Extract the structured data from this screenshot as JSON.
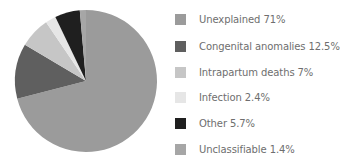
{
  "chart_data": {
    "type": "pie",
    "title": "",
    "start_angle_deg": 0,
    "direction": "clockwise",
    "legend_position": "right",
    "slices": [
      {
        "label": "Unexplained",
        "value": 71,
        "color": "#9b9b9b",
        "legend_text": "Unexplained 71%"
      },
      {
        "label": "Congenital anomalies",
        "value": 12.5,
        "color": "#5f5f5f",
        "legend_text": "Congenital anomalies 12.5%"
      },
      {
        "label": "Intrapartum deaths",
        "value": 7,
        "color": "#c6c6c6",
        "legend_text": "Intrapartum deaths 7%"
      },
      {
        "label": "Infection",
        "value": 2.4,
        "color": "#e6e6e6",
        "legend_text": "Infection 2.4%"
      },
      {
        "label": "Other",
        "value": 5.7,
        "color": "#1f1f1f",
        "legend_text": "Other 5.7%"
      },
      {
        "label": "Unclassifiable",
        "value": 1.4,
        "color": "#a6a6a6",
        "legend_text": "Unclassifiable 1.4%"
      }
    ]
  },
  "legend": {
    "items": [
      {
        "text": "Unexplained 71%"
      },
      {
        "text": "Congenital anomalies 12.5%"
      },
      {
        "text": "Intrapartum deaths 7%"
      },
      {
        "text": "Infection 2.4%"
      },
      {
        "text": "Other 5.7%"
      },
      {
        "text": "Unclassifiable 1.4%"
      }
    ]
  }
}
